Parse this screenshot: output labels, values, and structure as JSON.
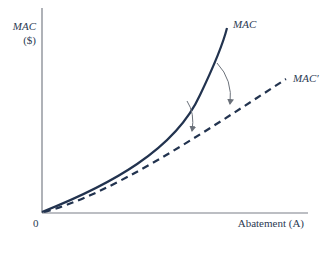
{
  "diagram": {
    "y_axis_label_line1": "MAC",
    "y_axis_label_line2": "($)",
    "x_axis_label": "Abatement (A)",
    "origin_label": "0",
    "curve_labels": {
      "original": "MAC",
      "shifted": "MAC′"
    },
    "colors": {
      "curve": "#22334f",
      "axis": "#7a7f88",
      "arrow": "#6b717a"
    }
  }
}
